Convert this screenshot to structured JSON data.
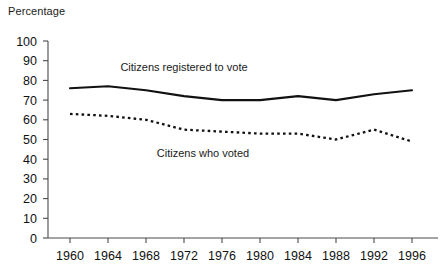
{
  "chart_data": {
    "type": "line",
    "title": "",
    "ylabel": "Percentage",
    "xlabel": "",
    "ylim": [
      0,
      100
    ],
    "ytick_step": 10,
    "grid": false,
    "legend_position": "inline-annotation",
    "categories": [
      "1960",
      "1964",
      "1968",
      "1972",
      "1976",
      "1980",
      "1984",
      "1988",
      "1992",
      "1996"
    ],
    "x": [
      1960,
      1964,
      1968,
      1972,
      1976,
      1980,
      1984,
      1988,
      1992,
      1996
    ],
    "yticks": [
      "0",
      "10",
      "20",
      "30",
      "40",
      "50",
      "60",
      "70",
      "80",
      "90",
      "100"
    ],
    "series": [
      {
        "name": "Citizens registered to vote",
        "style": "solid",
        "values": [
          76,
          77,
          75,
          72,
          70,
          70,
          72,
          70,
          73,
          75
        ]
      },
      {
        "name": "Citizens who voted",
        "style": "dotted",
        "values": [
          63,
          62,
          60,
          55,
          54,
          53,
          53,
          50,
          55,
          49
        ]
      }
    ],
    "annotations": [
      {
        "text": "Citizens registered to vote",
        "x": 1972,
        "y": 85
      },
      {
        "text": "Citizens who voted",
        "x": 1974,
        "y": 41
      }
    ]
  },
  "colors": {
    "line": "#111111",
    "axis": "#4a4a4a",
    "background": "#ffffff",
    "text": "#1a1a1a"
  }
}
